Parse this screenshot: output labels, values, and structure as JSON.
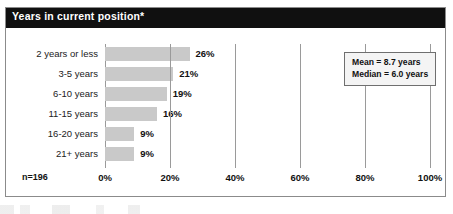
{
  "title": "Years in current position*",
  "sample_size_label": "n=196",
  "stats": {
    "mean": "Mean = 8.7 years",
    "median": "Median = 6.0 years"
  },
  "colors": {
    "title_bar": "#101010",
    "title_text": "#ffffff",
    "bar_fill": "#c9c9c9",
    "gridline": "#9a9a9a",
    "frame": "#8b8b8b"
  },
  "chart_data": {
    "type": "bar",
    "orientation": "horizontal",
    "title": "Years in current position*",
    "xlabel": "",
    "ylabel": "",
    "categories": [
      "2 years or less",
      "3-5 years",
      "6-10 years",
      "11-15 years",
      "16-20 years",
      "21+ years"
    ],
    "values": [
      26,
      21,
      19,
      16,
      9,
      9
    ],
    "value_labels": [
      "26%",
      "21%",
      "19%",
      "16%",
      "9%",
      "9%"
    ],
    "xlim": [
      0,
      100
    ],
    "xticks": [
      0,
      20,
      40,
      60,
      80,
      100
    ],
    "xtick_labels": [
      "0%",
      "20%",
      "40%",
      "60%",
      "80%",
      "100%"
    ],
    "grid": true,
    "legend": null,
    "annotations": [
      "Mean = 8.7 years",
      "Median = 6.0 years",
      "n=196"
    ],
    "sample_size": 196
  }
}
